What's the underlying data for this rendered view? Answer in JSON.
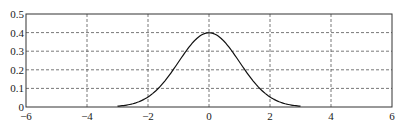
{
  "chart_data": {
    "type": "line",
    "title": "",
    "xlabel": "",
    "ylabel": "",
    "xlim": [
      -6,
      6
    ],
    "ylim": [
      0,
      0.5
    ],
    "grid": true,
    "grid_style": "dashed",
    "legend": null,
    "x_ticks": [
      -6,
      -4,
      -2,
      0,
      2,
      4,
      6
    ],
    "x_tick_labels": [
      "−6",
      "−4",
      "−2",
      "0",
      "2",
      "4",
      "6"
    ],
    "y_ticks": [
      0,
      0.1,
      0.2,
      0.3,
      0.4,
      0.5
    ],
    "y_tick_labels": [
      "0",
      "0.1",
      "0.2",
      "0.3",
      "0.4",
      "0.5"
    ],
    "series": [
      {
        "name": "standard normal pdf",
        "color": "#111111",
        "x": [
          -3.0,
          -2.5,
          -2.0,
          -1.5,
          -1.0,
          -0.5,
          0.0,
          0.5,
          1.0,
          1.5,
          2.0,
          2.5,
          3.0
        ],
        "y": [
          0.0044,
          0.0175,
          0.054,
          0.1295,
          0.242,
          0.3521,
          0.3989,
          0.3521,
          0.242,
          0.1295,
          0.054,
          0.0175,
          0.0044
        ]
      }
    ]
  },
  "colors": {
    "axes": "#333333",
    "grid": "#555555",
    "line": "#111111",
    "background": "#ffffff"
  }
}
